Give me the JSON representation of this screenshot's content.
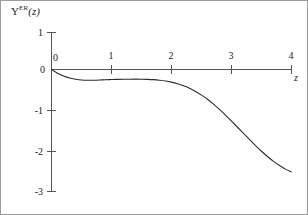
{
  "figure": {
    "background_color": "#ffffff",
    "border_color": "#9a9a9a",
    "axis_color": "#555555",
    "curve_color": "#2b2b2b"
  },
  "labels": {
    "y_axis_symbol": "Υ",
    "y_axis_superscript": "ER",
    "y_axis_argument": "(z)",
    "x_axis_name": "z"
  },
  "chart_data": {
    "type": "line",
    "title": "",
    "subtitle": "",
    "xlabel": "z",
    "ylabel": "Υ^ER(z)",
    "legend": [],
    "legend_position": "none",
    "grid": false,
    "xlim": [
      0,
      4
    ],
    "ylim": [
      -3,
      1
    ],
    "xticks": [
      0,
      1,
      2,
      3,
      4
    ],
    "xticklabels": [
      "0",
      "1",
      "2",
      "3",
      "4"
    ],
    "yticks": [
      1,
      0,
      -1,
      -2,
      -3
    ],
    "yticklabels": [
      "1",
      "0",
      "-1",
      "-2",
      "-3"
    ],
    "series": [
      {
        "name": "Υ^ER(z)",
        "x": [
          0.0,
          0.1,
          0.2,
          0.3,
          0.4,
          0.5,
          0.6,
          0.7,
          0.8,
          0.9,
          1.0,
          1.1,
          1.2,
          1.3,
          1.4,
          1.5,
          1.6,
          1.7,
          1.8,
          1.9,
          2.0,
          2.1,
          2.2,
          2.3,
          2.4,
          2.5,
          2.6,
          2.7,
          2.8,
          2.9,
          3.0,
          3.1,
          3.2,
          3.3,
          3.4,
          3.5,
          3.6,
          3.7,
          3.8,
          3.9,
          4.0
        ],
        "y": [
          0.0,
          -0.09,
          -0.16,
          -0.21,
          -0.24,
          -0.26,
          -0.265,
          -0.263,
          -0.258,
          -0.252,
          -0.247,
          -0.243,
          -0.24,
          -0.238,
          -0.237,
          -0.238,
          -0.242,
          -0.25,
          -0.263,
          -0.282,
          -0.31,
          -0.35,
          -0.4,
          -0.46,
          -0.54,
          -0.63,
          -0.73,
          -0.85,
          -0.98,
          -1.12,
          -1.27,
          -1.42,
          -1.57,
          -1.72,
          -1.87,
          -2.01,
          -2.14,
          -2.26,
          -2.36,
          -2.45,
          -2.52
        ]
      }
    ]
  }
}
